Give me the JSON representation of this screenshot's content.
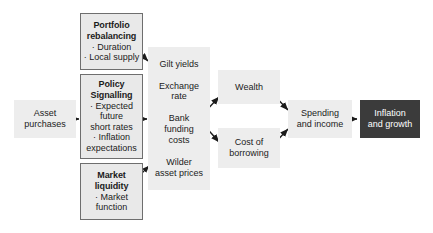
{
  "diagram": {
    "colors": {
      "panel_fill": "#ededed",
      "box_fill": "#e9e9e9",
      "box_border": "#6e6e6e",
      "terminal_fill": "#3b3b3b",
      "terminal_text": "#ffffff",
      "text": "#1b1b1b",
      "arrow": "#1b1b1b",
      "background": "#ffffff"
    },
    "nodes": {
      "asset_purchases": {
        "lines": [
          "Asset",
          "purchases"
        ]
      },
      "portfolio_rebalancing": {
        "title_lines": [
          "Portfolio",
          "rebalancing"
        ],
        "bullets": [
          "Duration",
          "Local supply"
        ]
      },
      "policy_signalling": {
        "title_lines": [
          "Policy",
          "Signalling"
        ],
        "bullets": [
          "Expected",
          "future",
          "short rates",
          "Inflation",
          "expectations"
        ],
        "bullet_markers": [
          true,
          false,
          false,
          true,
          false
        ]
      },
      "market_liquidity": {
        "title_lines": [
          "Market",
          "liquidity"
        ],
        "bullets": [
          "Market",
          "function"
        ],
        "bullet_markers": [
          true,
          false
        ]
      },
      "transmission_panel": {
        "items": [
          {
            "lines": [
              "Gilt yields"
            ]
          },
          {
            "lines": [
              "Exchange",
              "rate"
            ]
          },
          {
            "lines": [
              "Bank",
              "funding",
              "costs"
            ]
          },
          {
            "lines": [
              "Wilder",
              "asset prices"
            ]
          }
        ]
      },
      "wealth": {
        "lines": [
          "Wealth"
        ]
      },
      "cost_of_borrowing": {
        "lines": [
          "Cost of",
          "borrowing"
        ]
      },
      "spending_and_income": {
        "lines": [
          "Spending",
          "and income"
        ]
      },
      "inflation_and_growth": {
        "lines": [
          "Inflation",
          "and growth"
        ]
      }
    },
    "edges": [
      {
        "name": "asset-purchases-to-policy-signalling",
        "from": "asset_purchases",
        "to": "policy_signalling"
      },
      {
        "name": "portfolio-rebalancing-to-panel",
        "from": "portfolio_rebalancing",
        "to": "transmission_panel"
      },
      {
        "name": "policy-signalling-to-panel",
        "from": "policy_signalling",
        "to": "transmission_panel"
      },
      {
        "name": "market-liquidity-to-panel",
        "from": "market_liquidity",
        "to": "transmission_panel"
      },
      {
        "name": "panel-to-wealth",
        "from": "transmission_panel",
        "to": "wealth"
      },
      {
        "name": "panel-to-cost-of-borrowing",
        "from": "transmission_panel",
        "to": "cost_of_borrowing"
      },
      {
        "name": "wealth-to-spending",
        "from": "wealth",
        "to": "spending_and_income"
      },
      {
        "name": "cost-of-borrowing-to-spending",
        "from": "cost_of_borrowing",
        "to": "spending_and_income"
      },
      {
        "name": "spending-to-inflation",
        "from": "spending_and_income",
        "to": "inflation_and_growth"
      }
    ]
  }
}
